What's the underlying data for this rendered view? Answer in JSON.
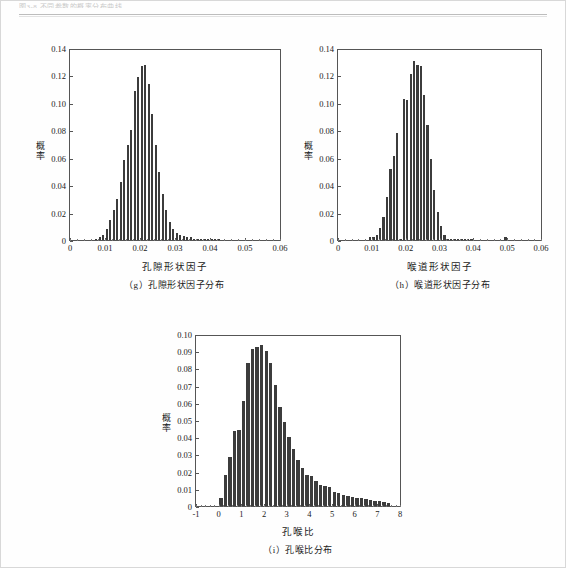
{
  "page": {
    "running_header": "图3-8  不同参数的概率分布曲线"
  },
  "figures": [
    {
      "id": "g",
      "caption": "（g）孔隙形状因子分布",
      "chart_data": {
        "type": "bar",
        "title": "",
        "xlabel": "孔隙形状因子",
        "ylabel": "概率",
        "xlim": [
          0,
          0.06
        ],
        "ylim": [
          0,
          0.14
        ],
        "xticks": [
          "0",
          "0.01",
          "0.02",
          "0.03",
          "0.04",
          "0.05",
          "0.06"
        ],
        "yticks": [
          "0",
          "0.02",
          "0.04",
          "0.06",
          "0.08",
          "0.10",
          "0.12",
          "0.14"
        ],
        "grid": false,
        "legend": null,
        "bin_width": 0.001,
        "x": [
          0.0075,
          0.0085,
          0.0095,
          0.0105,
          0.0115,
          0.0125,
          0.0135,
          0.0145,
          0.0155,
          0.0165,
          0.0175,
          0.0185,
          0.0195,
          0.0205,
          0.0215,
          0.0225,
          0.0235,
          0.0245,
          0.0255,
          0.0265,
          0.0275,
          0.0285,
          0.0295,
          0.0305,
          0.0315,
          0.0325,
          0.0335,
          0.0345,
          0.0355,
          0.0365,
          0.0375,
          0.0385,
          0.0395,
          0.0405,
          0.0415,
          0.0425
        ],
        "values": [
          0.001,
          0.002,
          0.004,
          0.008,
          0.015,
          0.022,
          0.03,
          0.043,
          0.059,
          0.07,
          0.081,
          0.11,
          0.12,
          0.128,
          0.129,
          0.115,
          0.093,
          0.07,
          0.05,
          0.034,
          0.022,
          0.013,
          0.008,
          0.005,
          0.004,
          0.003,
          0.002,
          0.002,
          0.001,
          0.001,
          0.001,
          0.0005,
          0.0005,
          0.0005,
          0.0003,
          0.0002
        ]
      }
    },
    {
      "id": "h",
      "caption": "（h）喉道形状因子分布",
      "chart_data": {
        "type": "bar",
        "title": "",
        "xlabel": "喉道形状因子",
        "ylabel": "概率",
        "xlim": [
          0,
          0.06
        ],
        "ylim": [
          0,
          0.14
        ],
        "xticks": [
          "0",
          "0.01",
          "0.02",
          "0.03",
          "0.04",
          "0.05",
          "0.06"
        ],
        "yticks": [
          "0",
          "0.02",
          "0.04",
          "0.06",
          "0.08",
          "0.10",
          "0.12",
          "0.14"
        ],
        "grid": false,
        "legend": null,
        "bin_width": 0.001,
        "x": [
          0.0095,
          0.0105,
          0.0115,
          0.0125,
          0.0135,
          0.0145,
          0.0155,
          0.0165,
          0.0175,
          0.0185,
          0.0195,
          0.0205,
          0.0215,
          0.0225,
          0.0235,
          0.0245,
          0.0255,
          0.0265,
          0.0275,
          0.0285,
          0.0295,
          0.0305,
          0.0315,
          0.0325,
          0.0335,
          0.0345,
          0.0355,
          0.0365,
          0.0375,
          0.0385,
          0.0395,
          0.0495
        ],
        "values": [
          0.002,
          0.002,
          0.004,
          0.009,
          0.017,
          0.032,
          0.052,
          0.062,
          0.079,
          0.001,
          0.104,
          0.103,
          0.122,
          0.132,
          0.129,
          0.128,
          0.107,
          0.085,
          0.06,
          0.037,
          0.021,
          0.01,
          0.004,
          0.001,
          0.0005,
          0.0003,
          0.0003,
          0.0002,
          0.0002,
          0.0001,
          0.0001,
          0.002
        ]
      }
    },
    {
      "id": "i",
      "caption": "（i）孔喉比分布",
      "chart_data": {
        "type": "bar",
        "title": "",
        "xlabel": "孔喉比",
        "ylabel": "概率",
        "xlim": [
          -1,
          8
        ],
        "ylim": [
          0,
          0.1
        ],
        "xticks": [
          "-1",
          "0",
          "1",
          "2",
          "3",
          "4",
          "5",
          "6",
          "7",
          "8"
        ],
        "yticks": [
          "0",
          "0.01",
          "0.02",
          "0.03",
          "0.04",
          "0.05",
          "0.06",
          "0.07",
          "0.08",
          "0.09",
          "0.10"
        ],
        "grid": false,
        "legend": null,
        "bin_width": 0.2,
        "x": [
          0.1,
          0.3,
          0.5,
          0.7,
          0.9,
          1.1,
          1.3,
          1.5,
          1.7,
          1.9,
          2.1,
          2.3,
          2.5,
          2.7,
          2.9,
          3.1,
          3.3,
          3.5,
          3.7,
          3.9,
          4.1,
          4.3,
          4.5,
          4.7,
          4.9,
          5.1,
          5.3,
          5.5,
          5.7,
          5.9,
          6.1,
          6.3,
          6.5,
          6.7,
          6.9,
          7.1,
          7.3,
          7.5
        ],
        "values": [
          0.0045,
          0.018,
          0.029,
          0.044,
          0.0445,
          0.0615,
          0.084,
          0.0925,
          0.0935,
          0.095,
          0.091,
          0.084,
          0.071,
          0.0585,
          0.0495,
          0.0405,
          0.0335,
          0.027,
          0.0225,
          0.0185,
          0.0175,
          0.0145,
          0.0125,
          0.0115,
          0.011,
          0.0085,
          0.0075,
          0.0065,
          0.006,
          0.0055,
          0.005,
          0.0045,
          0.004,
          0.0035,
          0.003,
          0.0028,
          0.0022,
          0.002
        ]
      }
    }
  ]
}
